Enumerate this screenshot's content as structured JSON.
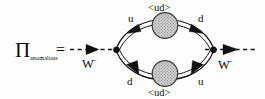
{
  "figure": {
    "kind": "feynman-diagram",
    "background_color": "#fefefe",
    "ink_color": "#121212",
    "blob_fill_color": "#c9c9c9"
  },
  "lhs": {
    "symbol": "Π",
    "subscript": "anomalous",
    "equals": "="
  },
  "external_legs": {
    "left": {
      "label": "W",
      "charge": "−",
      "line_style": "dashed",
      "direction": "right"
    },
    "right": {
      "label": "W",
      "charge": "−",
      "line_style": "dashed",
      "direction": "right"
    }
  },
  "vertices": [
    {
      "name": "left-vertex"
    },
    {
      "name": "right-vertex"
    }
  ],
  "loop": {
    "upper": {
      "left_quark": "u",
      "right_quark": "d",
      "condensate": "<ud>",
      "condensate_position": "above"
    },
    "lower": {
      "left_quark": "d",
      "right_quark": "u",
      "condensate": "<ud>",
      "condensate_position": "below"
    }
  }
}
